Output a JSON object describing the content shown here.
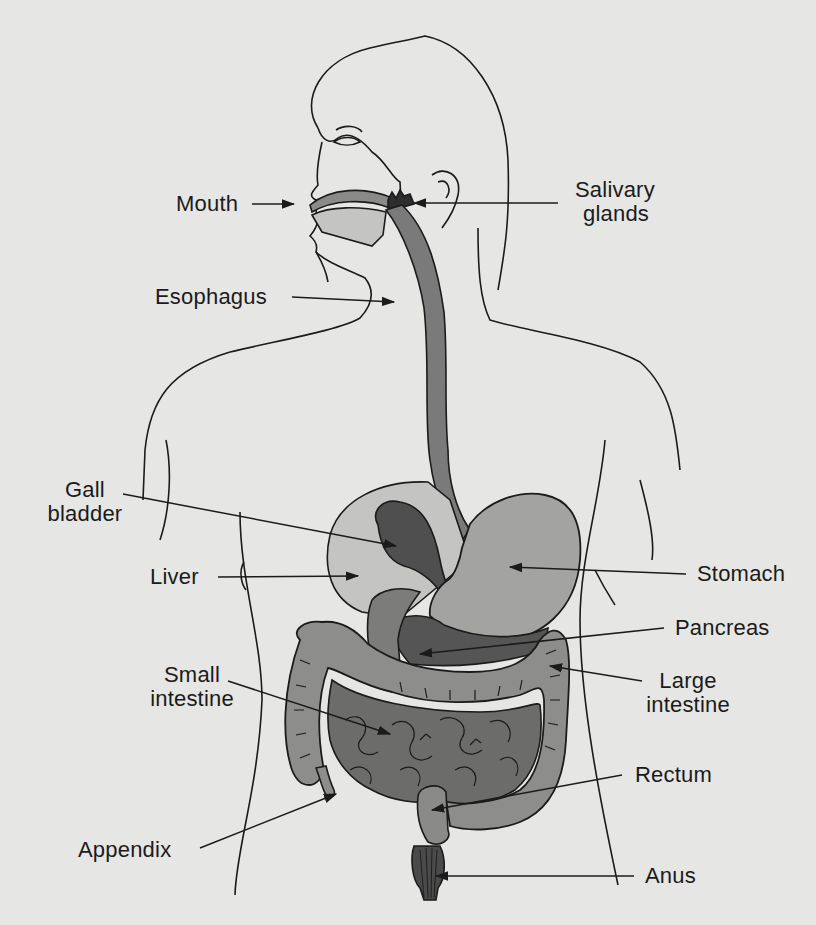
{
  "diagram": {
    "colors": {
      "background": "#e6e6e4",
      "outline": "#1b1b1b",
      "esophagus": "#7a7a7a",
      "liver": "#c4c4c2",
      "gall_bladder": "#4f4f4f",
      "stomach": "#a3a3a1",
      "pancreas": "#555555",
      "large_intestine": "#8d8d8b",
      "small_intestine": "#6c6c6a",
      "rectum": "#8a8a88",
      "anus": "#3d3d3d"
    },
    "labels": {
      "mouth": "Mouth",
      "salivary_glands_line1": "Salivary",
      "salivary_glands_line2": "glands",
      "esophagus": "Esophagus",
      "gall_bladder_line1": "Gall",
      "gall_bladder_line2": "bladder",
      "liver": "Liver",
      "stomach": "Stomach",
      "pancreas": "Pancreas",
      "small_intestine_line1": "Small",
      "small_intestine_line2": "intestine",
      "large_intestine_line1": "Large",
      "large_intestine_line2": "intestine",
      "rectum": "Rectum",
      "appendix": "Appendix",
      "anus": "Anus"
    }
  }
}
